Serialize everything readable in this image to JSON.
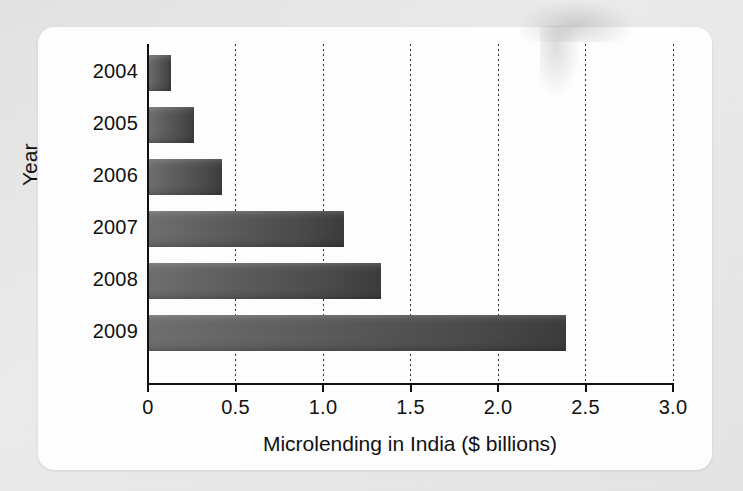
{
  "figure": {
    "background_color": "#e8e8e8",
    "card_color": "#fdfdfd",
    "bar_color": "#4a4a4a",
    "axis_color": "#101010"
  },
  "chart_data": {
    "type": "bar",
    "orientation": "horizontal",
    "title": "",
    "xlabel": "Microlending in India ($ billions)",
    "ylabel": "Year",
    "categories": [
      "2004",
      "2005",
      "2006",
      "2007",
      "2008",
      "2009"
    ],
    "values": [
      0.13,
      0.26,
      0.42,
      1.12,
      1.33,
      2.39
    ],
    "xlim": [
      0,
      3.0
    ],
    "xticks": [
      0,
      0.5,
      1.0,
      1.5,
      2.0,
      2.5,
      3.0
    ],
    "xticklabels": [
      "0",
      "0.5",
      "1.0",
      "1.5",
      "2.0",
      "2.5",
      "3.0"
    ],
    "grid": "vertical-dotted",
    "legend": "none",
    "series": [
      {
        "name": "Microlending in India ($ billions)",
        "values": [
          0.13,
          0.26,
          0.42,
          1.12,
          1.33,
          2.39
        ]
      }
    ]
  }
}
